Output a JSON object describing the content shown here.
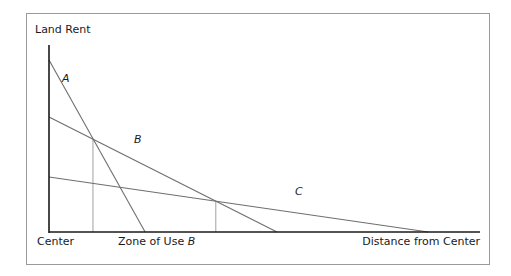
{
  "chart_data": {
    "type": "line",
    "title": "",
    "ylabel": "Land Rent",
    "xlabel": "Distance from Center",
    "origin_label": "Center",
    "zone_label": {
      "text": "Zone of Use ",
      "italic_part": "B"
    },
    "xlim": [
      0,
      100
    ],
    "ylim": [
      0,
      100
    ],
    "grid": false,
    "series": [
      {
        "name": "A",
        "points": [
          [
            0,
            92
          ],
          [
            22.3,
            0
          ]
        ]
      },
      {
        "name": "B",
        "points": [
          [
            0,
            61.5
          ],
          [
            52.9,
            0
          ]
        ]
      },
      {
        "name": "C",
        "points": [
          [
            0,
            29.4
          ],
          [
            88,
            0
          ]
        ]
      }
    ],
    "drop_lines_x": [
      10.2,
      38.7
    ],
    "colors": {
      "axis": "#1a1a1a",
      "line": "#6e6e6e",
      "drop": "#a0a0a0",
      "frame": "#9a9a9a"
    }
  }
}
